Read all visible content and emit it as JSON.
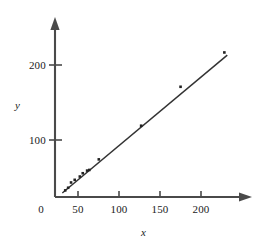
{
  "chart_data": {
    "type": "scatter",
    "title": "",
    "subtitle": "",
    "xlabel": "x",
    "ylabel": "y",
    "xlim": [
      0,
      245
    ],
    "ylim": [
      0,
      240
    ],
    "grid": false,
    "legend": null,
    "x_ticks": [
      0,
      50,
      100,
      150,
      200
    ],
    "x_tick_labels": [
      "0",
      "50",
      "100",
      "150",
      "200"
    ],
    "y_ticks": [
      100,
      200
    ],
    "y_tick_labels": [
      "100",
      "200"
    ],
    "axis_style": "arrow-terminated-spines",
    "marker": "small-filled-square",
    "marker_color": "#222222",
    "line_color": "#333333",
    "axis_color": "#444444",
    "points": [
      {
        "x": 14,
        "y": 10
      },
      {
        "x": 18,
        "y": 14
      },
      {
        "x": 22,
        "y": 22
      },
      {
        "x": 27,
        "y": 26
      },
      {
        "x": 34,
        "y": 31
      },
      {
        "x": 38,
        "y": 36
      },
      {
        "x": 44,
        "y": 40
      },
      {
        "x": 47,
        "y": 41
      },
      {
        "x": 60,
        "y": 57
      },
      {
        "x": 118,
        "y": 108
      },
      {
        "x": 172,
        "y": 167
      },
      {
        "x": 232,
        "y": 219
      }
    ],
    "fit_line": {
      "label": "least-squares line",
      "x_start": 10,
      "y_start": 6,
      "x_end": 236,
      "y_end": 215,
      "slope": 0.925,
      "intercept": -3.2
    }
  },
  "axes": {
    "x_axis_name": "x-axis",
    "y_axis_name": "y-axis",
    "x_title": "x",
    "y_title": "y"
  }
}
